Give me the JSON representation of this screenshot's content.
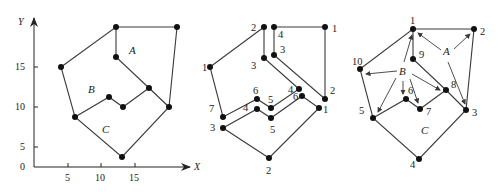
{
  "figure": {
    "panel_left": {
      "axes": {
        "x_label": "X",
        "y_label": "Y",
        "origin_label": "0",
        "x_ticks": [
          "5",
          "10",
          "15"
        ],
        "y_ticks": [
          "5",
          "10",
          "15"
        ]
      },
      "regions": {
        "A": "A",
        "B": "B",
        "C": "C"
      },
      "vertices": [
        {
          "x": 116,
          "y": 27
        },
        {
          "x": 177,
          "y": 27
        },
        {
          "x": 61,
          "y": 67
        },
        {
          "x": 116,
          "y": 57
        },
        {
          "x": 149,
          "y": 88
        },
        {
          "x": 109,
          "y": 97
        },
        {
          "x": 123,
          "y": 107
        },
        {
          "x": 75,
          "y": 117
        },
        {
          "x": 169,
          "y": 107
        },
        {
          "x": 122,
          "y": 157
        }
      ]
    },
    "panel_middle": {
      "labels": {
        "top_2": "2",
        "top_4": "4",
        "top_right_1": "1",
        "left_1": "1",
        "upper_3": "3",
        "inner_3": "3",
        "right_2": "2",
        "mid_4": "4",
        "mid_6": "6",
        "right_1": "1",
        "inner_6": "6",
        "inner_5": "5",
        "lower_4": "4",
        "lower_5": "5",
        "left_7": "7",
        "left_3": "3",
        "bottom_2": "2"
      }
    },
    "panel_right": {
      "labels": {
        "v1": "1",
        "v2": "2",
        "v3": "3",
        "v4": "4",
        "v5": "5",
        "v6": "6",
        "v7": "7",
        "v8": "8",
        "v9": "9",
        "v10": "10"
      },
      "regions": {
        "A": "A",
        "B": "B",
        "C": "C"
      }
    }
  }
}
